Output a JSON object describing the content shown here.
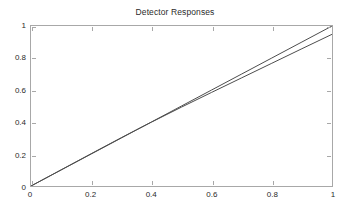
{
  "chart_data": {
    "type": "line",
    "title": "Detector Responses",
    "xlabel": "",
    "ylabel": "",
    "xlim": [
      0,
      1
    ],
    "ylim": [
      0,
      1
    ],
    "xticks": [
      "0",
      "0.2",
      "0.4",
      "0.6",
      "0.8",
      "1"
    ],
    "yticks": [
      "0",
      "0.2",
      "0.4",
      "0.6",
      "0.8",
      "1"
    ],
    "xtick_values": [
      0,
      0.2,
      0.4,
      0.6,
      0.8,
      1
    ],
    "ytick_values": [
      0,
      0.2,
      0.4,
      0.6,
      0.8,
      1
    ],
    "grid": false,
    "legend": "none",
    "axis_box": true,
    "tick_direction": "in",
    "series": [
      {
        "name": "reference",
        "color": "#4d4d4d",
        "x": [
          0,
          0.1,
          0.2,
          0.3,
          0.4,
          0.5,
          0.6,
          0.7,
          0.8,
          0.9,
          1
        ],
        "values": [
          0,
          0.1,
          0.2,
          0.3,
          0.4,
          0.5,
          0.6,
          0.7,
          0.8,
          0.9,
          1
        ]
      },
      {
        "name": "detector",
        "color": "#4d4d4d",
        "x": [
          0,
          0.1,
          0.2,
          0.3,
          0.35,
          0.4,
          0.5,
          0.6,
          0.7,
          0.8,
          0.9,
          1
        ],
        "values": [
          0,
          0.101,
          0.202,
          0.302,
          0.351,
          0.399,
          0.493,
          0.585,
          0.676,
          0.767,
          0.858,
          0.948
        ]
      }
    ]
  },
  "colors": {
    "background": "#ffffff",
    "axis": "#a8a8a8",
    "text": "#2b2b2b",
    "line": "#4d4d4d"
  }
}
